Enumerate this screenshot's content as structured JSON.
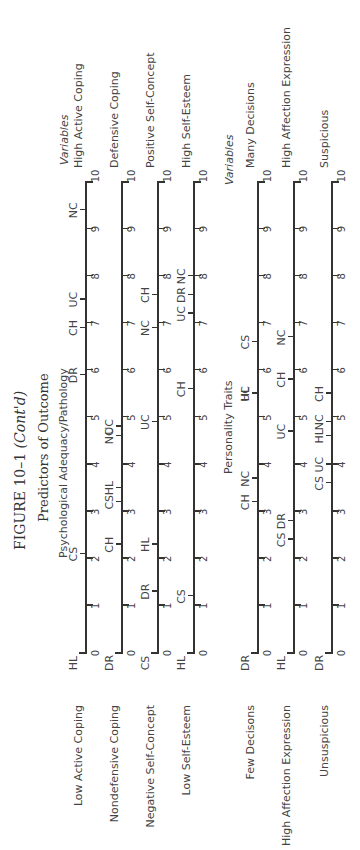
{
  "figure": {
    "title_main": "FIGURE 10–1",
    "title_suffix": "(Cont'd)",
    "subtitle": "Predictors of Outcome",
    "section1": "Psychological Adequacy/Pathology",
    "section2": "Personality Traits",
    "variables_header": "Variables"
  },
  "chart_data": {
    "type": "scatter",
    "title": "FIGURE 10–1 (Cont'd) Predictors of Outcome",
    "xlabel": "",
    "ylabel": "",
    "xlim": [
      0,
      10
    ],
    "ticks": [
      "0",
      "1",
      "2",
      "3",
      "4",
      "5",
      "6",
      "7",
      "8",
      "9",
      "10"
    ],
    "groups": [
      {
        "name": "Psychological Adequacy/Pathology",
        "scales": [
          {
            "left": "Low Active Coping",
            "right": "High Active Coping",
            "points": [
              {
                "code": "HL",
                "value": 0
              },
              {
                "code": "CS",
                "value": 2.1
              },
              {
                "code": "DR",
                "value": 5.9
              },
              {
                "code": "CH",
                "value": 6.9
              },
              {
                "code": "UC",
                "value": 7.5
              },
              {
                "code": "NC",
                "value": 9.4
              }
            ]
          },
          {
            "left": "Nondefensive Coping",
            "right": "Defensive Coping",
            "points": [
              {
                "code": "DR",
                "value": 0
              },
              {
                "code": "CH",
                "value": 2.3
              },
              {
                "code": "CS",
                "value": 3.2
              },
              {
                "code": "HL",
                "value": 3.5
              },
              {
                "code": "NC",
                "value": 4.6
              },
              {
                "code": "UC",
                "value": 4.8
              }
            ]
          },
          {
            "left": "Negative Self-Concept",
            "right": "Positive Self-Concept",
            "points": [
              {
                "code": "CS",
                "value": 0
              },
              {
                "code": "DR",
                "value": 1.3
              },
              {
                "code": "HL",
                "value": 2.3
              },
              {
                "code": "UC",
                "value": 4.9
              },
              {
                "code": "NC",
                "value": 6.9
              },
              {
                "code": "CH",
                "value": 7.6
              }
            ]
          },
          {
            "left": "Low Self-Esteem",
            "right": "High Self-Esteem",
            "points": [
              {
                "code": "HL",
                "value": 0
              },
              {
                "code": "CS",
                "value": 1.2
              },
              {
                "code": "CH",
                "value": 5.6
              },
              {
                "code": "UC",
                "value": 7.2
              },
              {
                "code": "DR",
                "value": 7.6
              },
              {
                "code": "NC",
                "value": 8.0
              }
            ]
          }
        ]
      },
      {
        "name": "Personality Traits",
        "scales": [
          {
            "left": "Few Decisons",
            "right": "Many Decisions",
            "points": [
              {
                "code": "DR",
                "value": 0
              },
              {
                "code": "CH",
                "value": 3.2
              },
              {
                "code": "NC",
                "value": 3.7
              },
              {
                "code": "UC",
                "value": 5.5
              },
              {
                "code": "HL",
                "value": 5.5
              },
              {
                "code": "CS",
                "value": 6.6
              }
            ]
          },
          {
            "left": "High Affection Expression",
            "right": "High Affection Expression",
            "points": [
              {
                "code": "HL",
                "value": 0
              },
              {
                "code": "CS",
                "value": 2.4
              },
              {
                "code": "DR",
                "value": 2.8
              },
              {
                "code": "UC",
                "value": 4.7
              },
              {
                "code": "CH",
                "value": 5.8
              },
              {
                "code": "NC",
                "value": 6.7
              }
            ]
          },
          {
            "left": "Unsuspicious",
            "right": "Suspicious",
            "points": [
              {
                "code": "DR",
                "value": 0
              },
              {
                "code": "CS",
                "value": 3.6
              },
              {
                "code": "UC",
                "value": 4.0
              },
              {
                "code": "HL",
                "value": 4.6
              },
              {
                "code": "NC",
                "value": 4.9
              },
              {
                "code": "CH",
                "value": 5.5
              }
            ]
          }
        ]
      }
    ]
  }
}
